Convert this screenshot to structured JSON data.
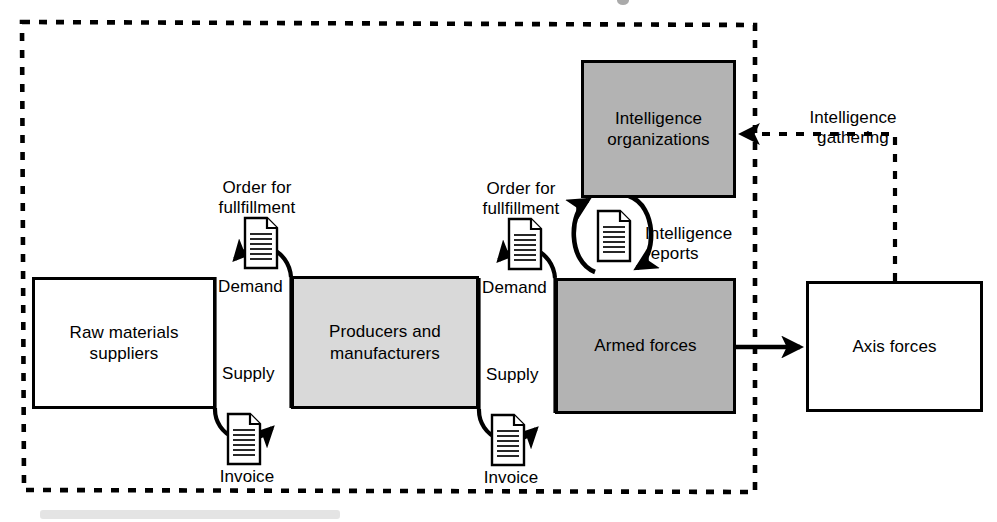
{
  "diagram": {
    "boundary": {
      "name": "national-boundary",
      "style": "dashed",
      "color": "#000000"
    },
    "colors": {
      "white_fill": "#ffffff",
      "light_gray_fill": "#d9d9d9",
      "mid_gray_fill": "#b3b3b3",
      "stroke": "#000000"
    },
    "nodes": [
      {
        "id": "raw",
        "label": "Raw materials\nsuppliers",
        "fill": "#ffffff"
      },
      {
        "id": "producers",
        "label": "Producers and\nmanufacturers",
        "fill": "#d9d9d9"
      },
      {
        "id": "armed",
        "label": "Armed forces",
        "fill": "#b3b3b3"
      },
      {
        "id": "intel",
        "label": "Intelligence\norganizations",
        "fill": "#b3b3b3"
      },
      {
        "id": "axis",
        "label": "Axis forces",
        "fill": "#ffffff"
      }
    ],
    "edge_labels": {
      "order_1": "Order for\nfullfillment",
      "demand_1": "Demand",
      "supply_1": "Supply",
      "invoice_1": "Invoice",
      "order_2": "Order for\nfullfillment",
      "demand_2": "Demand",
      "supply_2": "Supply",
      "invoice_2": "Invoice",
      "intelligence_reports": "Intelligence\nreports",
      "intelligence_gathering": "Intelligence\ngathering"
    },
    "icons": {
      "document": "document-icon"
    }
  }
}
